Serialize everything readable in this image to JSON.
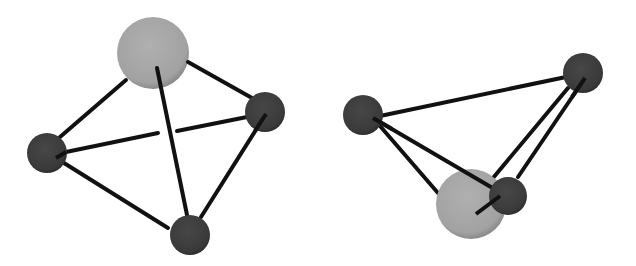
{
  "diagram": {
    "title": "",
    "colors": {
      "large_atom": "#a6a6a6",
      "small_atom": "#3e3e3e",
      "bond": "#111111",
      "background": "#ffffff"
    },
    "panels": [
      {
        "name": "left-view",
        "atoms": [
          {
            "id": "A",
            "kind": "large"
          },
          {
            "id": "B",
            "kind": "small"
          },
          {
            "id": "C",
            "kind": "small"
          },
          {
            "id": "D",
            "kind": "small"
          }
        ],
        "bonds": [
          [
            "A",
            "B"
          ],
          [
            "A",
            "C"
          ],
          [
            "A",
            "D"
          ],
          [
            "B",
            "C"
          ],
          [
            "B",
            "D"
          ],
          [
            "C",
            "D"
          ]
        ]
      },
      {
        "name": "right-view",
        "atoms": [
          {
            "id": "A",
            "kind": "large"
          },
          {
            "id": "B",
            "kind": "small"
          },
          {
            "id": "C",
            "kind": "small"
          },
          {
            "id": "D",
            "kind": "small"
          }
        ],
        "bonds": [
          [
            "A",
            "B"
          ],
          [
            "A",
            "C"
          ],
          [
            "A",
            "D"
          ],
          [
            "B",
            "C"
          ],
          [
            "B",
            "D"
          ],
          [
            "C",
            "D"
          ]
        ]
      }
    ]
  }
}
